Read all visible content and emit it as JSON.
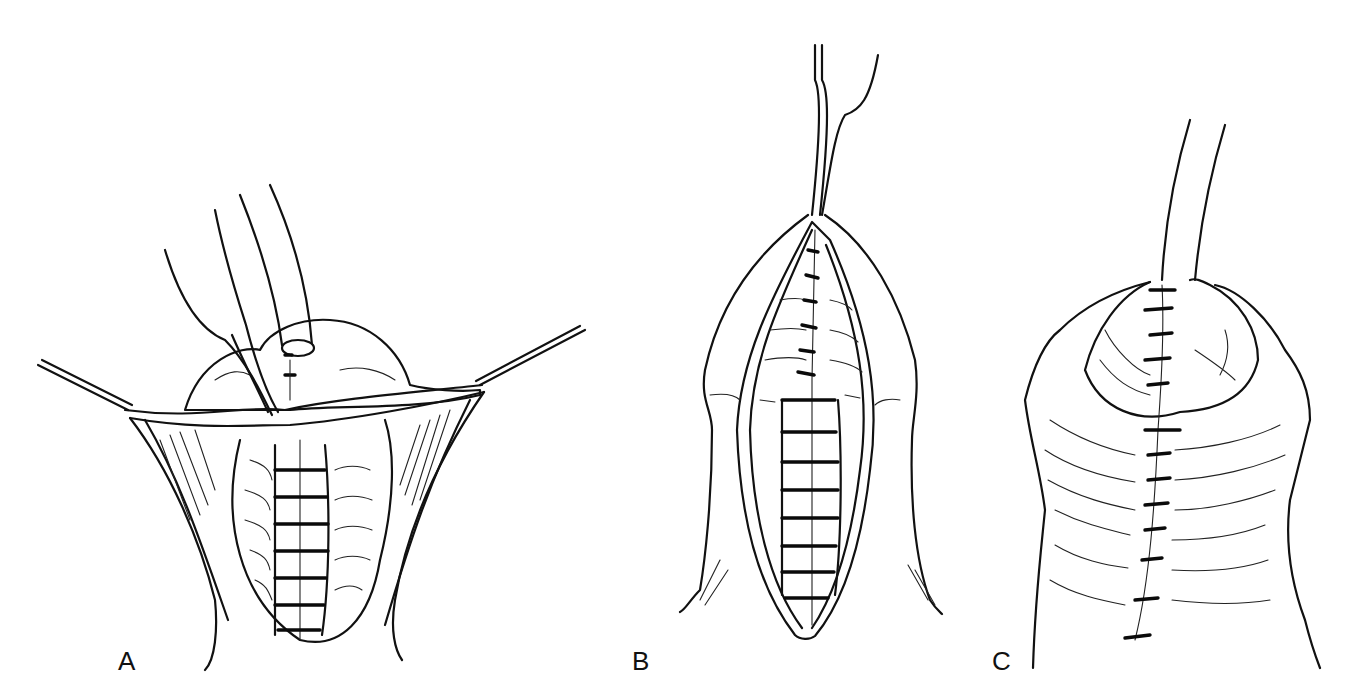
{
  "figure": {
    "panels": [
      {
        "id": "A",
        "label": "A",
        "description": "Retracted skin flaps with suture line in midline and catheter in glans"
      },
      {
        "id": "B",
        "label": "B",
        "description": "Elliptical incision with layered closure, forceps at apex"
      },
      {
        "id": "C",
        "label": "C",
        "description": "Completed skin closure with interrupted sutures and catheter"
      }
    ],
    "colors": {
      "ink": "#111111",
      "background": "#ffffff"
    }
  }
}
